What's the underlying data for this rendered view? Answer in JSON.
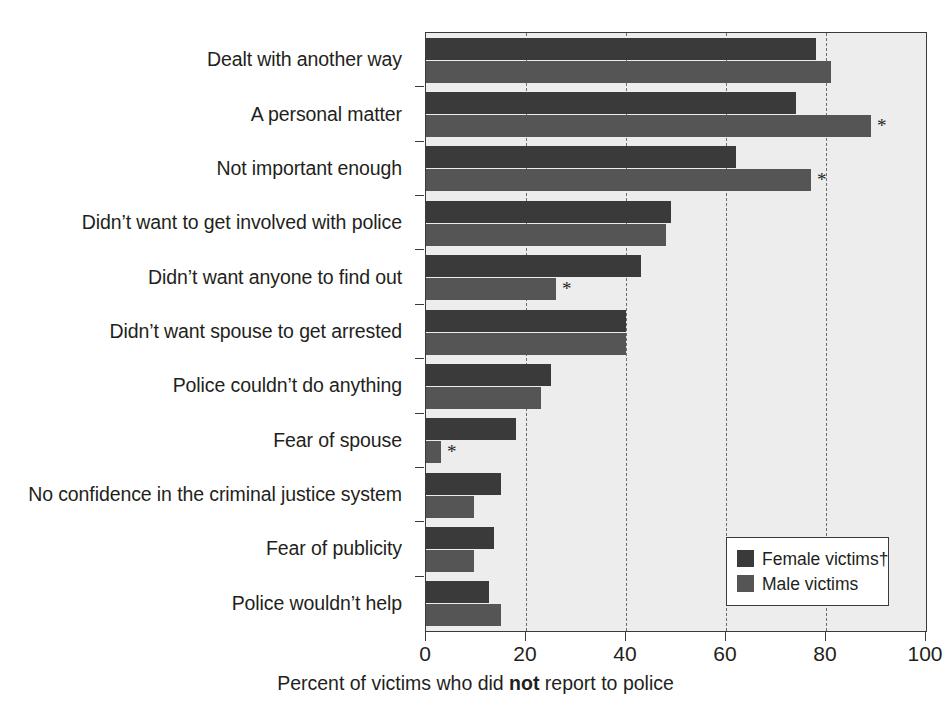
{
  "chart_data": {
    "type": "bar",
    "orientation": "horizontal",
    "title": "",
    "xlabel_prefix": "Percent of victims who did ",
    "xlabel_emphasis": "not",
    "xlabel_suffix": " report to police",
    "ylabel": "",
    "xlim": [
      0,
      100
    ],
    "xticks": [
      0,
      20,
      40,
      60,
      80,
      100
    ],
    "xticklabels": [
      "0",
      "20",
      "40",
      "60",
      "80",
      "100"
    ],
    "grid": "vertical-dashed",
    "legend_position": "lower-right",
    "categories": [
      "Dealt with another way",
      "A personal matter",
      "Not important enough",
      "Didn’t want to get involved with police",
      "Didn’t want anyone to find out",
      "Didn’t want spouse to get arrested",
      "Police couldn’t do anything",
      "Fear of spouse",
      "No confidence in the criminal justice system",
      "Fear of publicity",
      "Police wouldn’t help"
    ],
    "series": [
      {
        "name": "Female victims†",
        "key": "female",
        "color": "#3a3a3a",
        "values": [
          78,
          74,
          62,
          49,
          43,
          40,
          25,
          18,
          15,
          13.5,
          12.5
        ],
        "significance_marks": [
          false,
          false,
          false,
          false,
          false,
          false,
          false,
          false,
          false,
          false,
          false
        ]
      },
      {
        "name": "Male victims",
        "key": "male",
        "color": "#555555",
        "values": [
          81,
          89,
          77,
          48,
          26,
          40,
          23,
          3,
          9.5,
          9.5,
          15
        ],
        "significance_marks": [
          false,
          true,
          true,
          false,
          true,
          false,
          false,
          true,
          false,
          false,
          false
        ]
      }
    ],
    "significance_symbol": "*",
    "plot_background": "#ededed",
    "frame_color": "#3a3a3a",
    "gridline_color": "#6d6d6d"
  },
  "legend": {
    "items": [
      {
        "label": "Female victims†",
        "color": "#3a3a3a"
      },
      {
        "label": "Male victims",
        "color": "#555555"
      }
    ]
  }
}
